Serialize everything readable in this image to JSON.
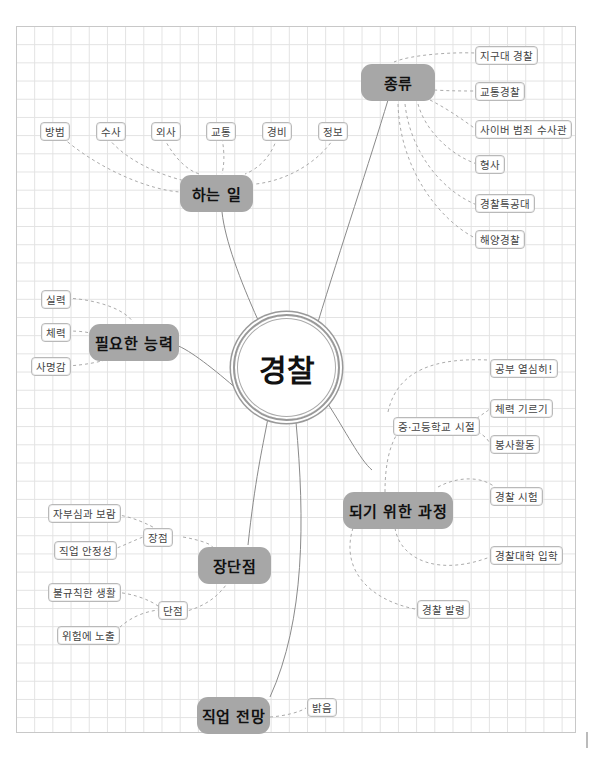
{
  "center": {
    "label": "경찰"
  },
  "colors": {
    "branch_fill": "#a7a7a7",
    "line": "#888888",
    "dashed": "#aaaaaa",
    "grid": "#e2e2e2"
  },
  "branches": [
    {
      "id": "duties",
      "label": "하는 일",
      "children": [
        "방범",
        "수사",
        "외사",
        "교통",
        "경비",
        "정보"
      ]
    },
    {
      "id": "types",
      "label": "종류",
      "children": [
        "지구대 경찰",
        "교통경찰",
        "사이버 범죄 수사관",
        "형사",
        "경찰특공대",
        "해양경찰"
      ]
    },
    {
      "id": "skills",
      "label": "필요한 능력",
      "children": [
        "실력",
        "체력",
        "사명감"
      ]
    },
    {
      "id": "path",
      "label": "되기 위한 과정",
      "children": [
        {
          "label": "중·고등학교 시절",
          "children": [
            "공부 열심히!",
            "체력 기르기",
            "봉사활동"
          ]
        },
        "경찰 시험",
        "경찰대학 입학",
        "경찰 발령"
      ]
    },
    {
      "id": "proscons",
      "label": "장단점",
      "children": [
        {
          "label": "장점",
          "children": [
            "자부심과 보람",
            "직업 안정성"
          ]
        },
        {
          "label": "단점",
          "children": [
            "불규칙한 생활",
            "위험에 노출"
          ]
        }
      ]
    },
    {
      "id": "outlook",
      "label": "직업 전망",
      "children": [
        "밝음"
      ]
    }
  ]
}
